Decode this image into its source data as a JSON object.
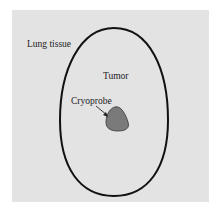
{
  "diagram": {
    "labels": {
      "lung_tissue": "Lung tissue",
      "tumor": "Tumor",
      "cryoprobe": "Cryoprobe"
    },
    "colors": {
      "background": "#e3e3e3",
      "tumor_outline": "#111111",
      "cryoprobe_fill": "#7a7a7a"
    }
  }
}
